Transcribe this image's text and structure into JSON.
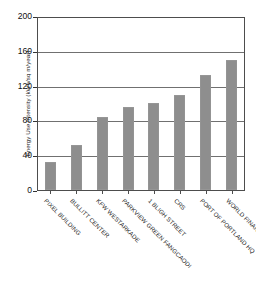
{
  "chart_data": {
    "type": "bar",
    "title": "",
    "subtitle": "",
    "xlabel": "",
    "ylabel": "Energy Use Intensity (kWh/sq m/year)",
    "ylim": [
      0,
      200
    ],
    "yticks": [
      0,
      40,
      80,
      120,
      160,
      200
    ],
    "ytick_labels": [
      "0",
      "40",
      "80",
      "120",
      "160",
      "200"
    ],
    "grid": true,
    "legend": false,
    "bar_color": "#8e8e8e",
    "categories": [
      "PIXEL BUILDING",
      "BULLITT CENTER",
      "KFW WESTARKADE",
      "PARKVIEW GREEN FANGCAODI",
      "1 BLIGH STREET",
      "CRS",
      "PORT OF PORTLAND HQ",
      "WORLD FINANCIAL CENTER"
    ],
    "values": [
      33,
      52,
      85,
      97,
      101,
      110,
      134,
      151
    ]
  },
  "axes": {
    "y_title": "Energy Use Intensity (kWh/sq m/year)"
  }
}
